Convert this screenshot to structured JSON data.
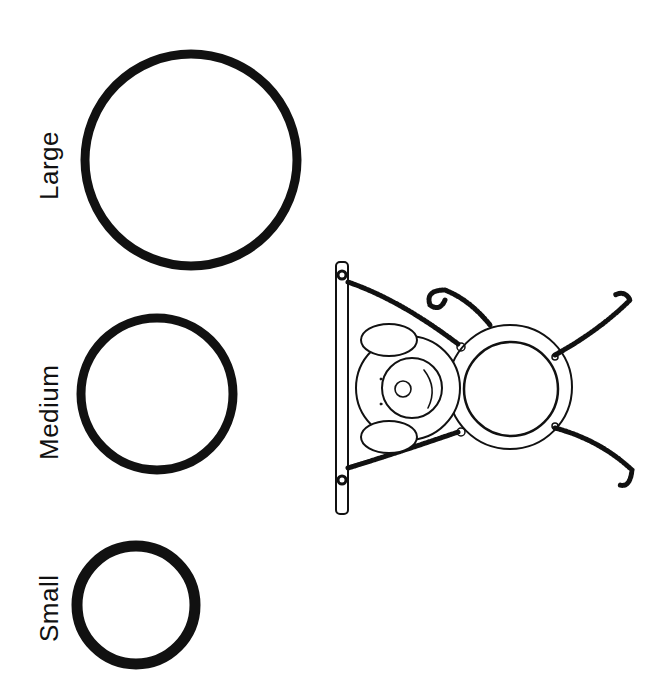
{
  "worksheet": {
    "labels": {
      "large": "Large",
      "medium": "Medium",
      "small": "Small"
    },
    "circles": [
      {
        "size": "large",
        "cx": 191,
        "cy": 160,
        "r": 107
      },
      {
        "size": "medium",
        "cx": 157,
        "cy": 394,
        "r": 77
      },
      {
        "size": "small",
        "cx": 136,
        "cy": 605,
        "r": 61
      }
    ],
    "illustration": "monkey-swinging-from-bar-with-pipe-cleaner-arms",
    "colors": {
      "ink": "#111111",
      "background": "#ffffff"
    }
  }
}
